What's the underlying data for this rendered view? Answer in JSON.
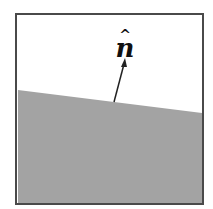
{
  "diagram": {
    "label": "n",
    "label_hat": "^",
    "colors": {
      "frame": "#4a4a4a",
      "surface": "#a3a3a3",
      "background": "#ffffff",
      "vector": "#222222"
    }
  }
}
